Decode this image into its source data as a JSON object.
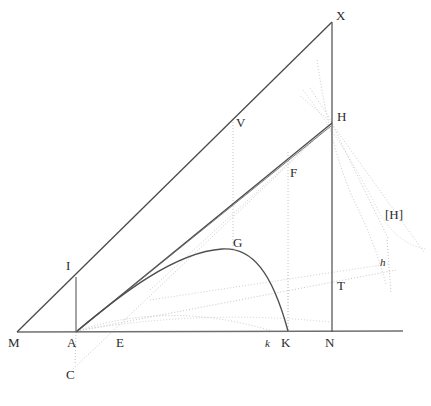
{
  "figure": {
    "background_color": "#ffffff",
    "stroke_color_solid": "#3a3a3a",
    "stroke_color_dotted": "#b9b9b9",
    "stroke_color_baseline": "#6a6a6a",
    "label_color": "#2b2b2b",
    "width": 431,
    "height": 406
  },
  "labels": {
    "M": "M",
    "A": "A",
    "E": "E",
    "k_lower": "k",
    "K": "K",
    "N": "N",
    "C": "C",
    "I": "I",
    "G": "G",
    "V": "V",
    "F": "F",
    "X": "X",
    "H": "H",
    "T": "T",
    "H_bracket": "[H]",
    "h_italic": "h"
  },
  "points": {
    "M": {
      "x": 17,
      "y": 332
    },
    "A": {
      "x": 76,
      "y": 332
    },
    "E": {
      "x": 122,
      "y": 332
    },
    "k_lower": {
      "x": 272,
      "y": 332
    },
    "K": {
      "x": 288,
      "y": 332
    },
    "N": {
      "x": 332,
      "y": 332
    },
    "C": {
      "x": 76,
      "y": 366
    },
    "I": {
      "x": 76,
      "y": 278
    },
    "G": {
      "x": 228,
      "y": 249
    },
    "V": {
      "x": 233,
      "y": 120
    },
    "F": {
      "x": 288,
      "y": 155
    },
    "X": {
      "x": 332,
      "y": 22
    },
    "H": {
      "x": 332,
      "y": 123
    },
    "T": {
      "x": 332,
      "y": 290
    },
    "H_bracket": {
      "x": 386,
      "y": 234
    },
    "h_italic": {
      "x": 382,
      "y": 272
    },
    "baseline_right_end": {
      "x": 403,
      "y": 332
    }
  },
  "label_positions": {
    "M": {
      "x": 8,
      "y": 338
    },
    "A": {
      "x": 68,
      "y": 338
    },
    "E": {
      "x": 117,
      "y": 338
    },
    "k_lower": {
      "x": 266,
      "y": 339
    },
    "K": {
      "x": 281,
      "y": 338
    },
    "N": {
      "x": 325,
      "y": 338
    },
    "C": {
      "x": 66,
      "y": 371
    },
    "I": {
      "x": 66,
      "y": 261
    },
    "G": {
      "x": 233,
      "y": 236
    },
    "V": {
      "x": 236,
      "y": 117
    },
    "F": {
      "x": 290,
      "y": 167
    },
    "X": {
      "x": 336,
      "y": 10
    },
    "H": {
      "x": 337,
      "y": 111
    },
    "T": {
      "x": 337,
      "y": 280
    },
    "H_bracket": {
      "x": 386,
      "y": 209
    },
    "h_italic": {
      "x": 380,
      "y": 258
    }
  },
  "geometry_description": {
    "baseline": "Horizontal axis M-A-E-k-K-N extending right",
    "solid_lines": [
      "M to X (long upper hypotenuse)",
      "A to H (lower hypotenuse through V-F region)",
      "A to I (short vertical at A)",
      "X to N (vertical right side)",
      "M to A to baseline right end"
    ],
    "curves": [
      "Parabolic arc from A rising to apex G then descending to K",
      "Dotted low arc from A to k",
      "Dotted arc through H descending to right"
    ],
    "dotted_lines": [
      "C to E extended up-right to H",
      "Vertical dotted at V (x=233) down to curve",
      "Vertical dotted at F (x=288) down to K",
      "Vertical dotted at A down to C",
      "Fan of dotted rays from H toward lower right",
      "Dotted line from lower-left rising to h on right"
    ]
  }
}
